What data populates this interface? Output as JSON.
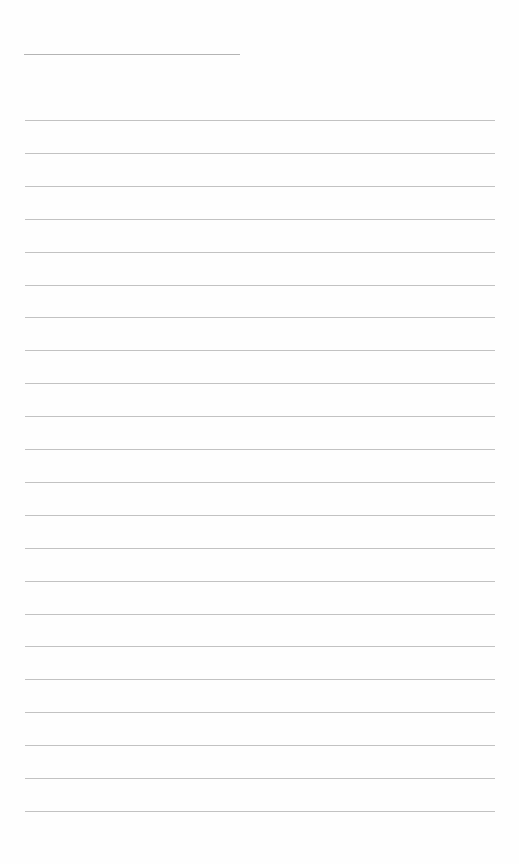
{
  "page": {
    "type": "blank lined notebook page",
    "background_color": "#fefefe",
    "line_color": "#c2c2c2",
    "title_line": {
      "present": true,
      "text": ""
    },
    "ruled_line_count": 22,
    "ruled_lines": [
      {
        "text": ""
      },
      {
        "text": ""
      },
      {
        "text": ""
      },
      {
        "text": ""
      },
      {
        "text": ""
      },
      {
        "text": ""
      },
      {
        "text": ""
      },
      {
        "text": ""
      },
      {
        "text": ""
      },
      {
        "text": ""
      },
      {
        "text": ""
      },
      {
        "text": ""
      },
      {
        "text": ""
      },
      {
        "text": ""
      },
      {
        "text": ""
      },
      {
        "text": ""
      },
      {
        "text": ""
      },
      {
        "text": ""
      },
      {
        "text": ""
      },
      {
        "text": ""
      },
      {
        "text": ""
      },
      {
        "text": ""
      }
    ]
  }
}
